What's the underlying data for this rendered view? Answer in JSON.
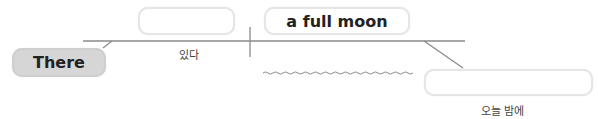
{
  "diagram": {
    "type": "sentence-diagram",
    "subject": {
      "text": "There"
    },
    "slots": [
      {
        "id": "verb-slot",
        "text": "",
        "hint": "있다"
      },
      {
        "id": "object-slot",
        "text": "a full moon"
      },
      {
        "id": "modifier-slot",
        "text": "",
        "hint": "오늘 밤에"
      }
    ],
    "colors": {
      "line": "#8a8a8a",
      "box_border": "#e6e6e6",
      "subject_fill": "#d6d6d6",
      "text": "#222222"
    }
  }
}
